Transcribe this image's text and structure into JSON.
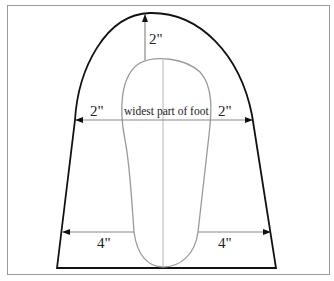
{
  "diagram": {
    "type": "pattern-template",
    "colors": {
      "outer_outline": "#111111",
      "foot_outline": "#9a9a9a",
      "arrows": "#8a8a8a",
      "frame": "#9a9a9a",
      "text": "#222222"
    },
    "labels": {
      "top_allowance": "2\"",
      "widest_part": "widest part of foot",
      "left_allowance": "2\"",
      "right_allowance": "2\"",
      "heel_left_allowance": "4\"",
      "heel_right_allowance": "4\""
    },
    "measurements": [
      {
        "position": "toe (top)",
        "value": "2\""
      },
      {
        "position": "widest part of foot, left",
        "value": "2\""
      },
      {
        "position": "widest part of foot, right",
        "value": "2\""
      },
      {
        "position": "heel area, left",
        "value": "4\""
      },
      {
        "position": "heel area, right",
        "value": "4\""
      }
    ]
  }
}
